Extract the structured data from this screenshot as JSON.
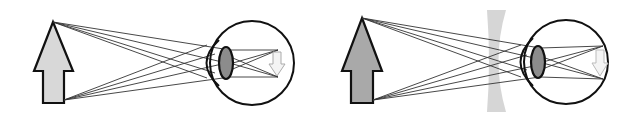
{
  "diagram": {
    "title": "Myopia and correction with a concave lens",
    "panels": [
      {
        "id": "uncorrected",
        "description": "Myopic eye: rays from object focus in front of retina",
        "object": {
          "label": "object-arrow",
          "fill": "#d8d8d8"
        },
        "image": {
          "label": "inverted-image",
          "fill": "#f4f4f4"
        },
        "lens_fill": "#8c8c8c"
      },
      {
        "id": "corrected",
        "description": "Concave (diverging) lens corrects myopia",
        "object": {
          "label": "object-arrow",
          "fill": "#a9a9a9"
        },
        "corrective_lens": {
          "type": "concave",
          "fill": "#d6d6d6"
        },
        "image": {
          "label": "inverted-image",
          "fill": "#f4f4f4"
        },
        "lens_fill": "#8c8c8c"
      }
    ],
    "colors": {
      "stroke": "#111111",
      "ray": "#333333",
      "background": "#ffffff"
    }
  }
}
